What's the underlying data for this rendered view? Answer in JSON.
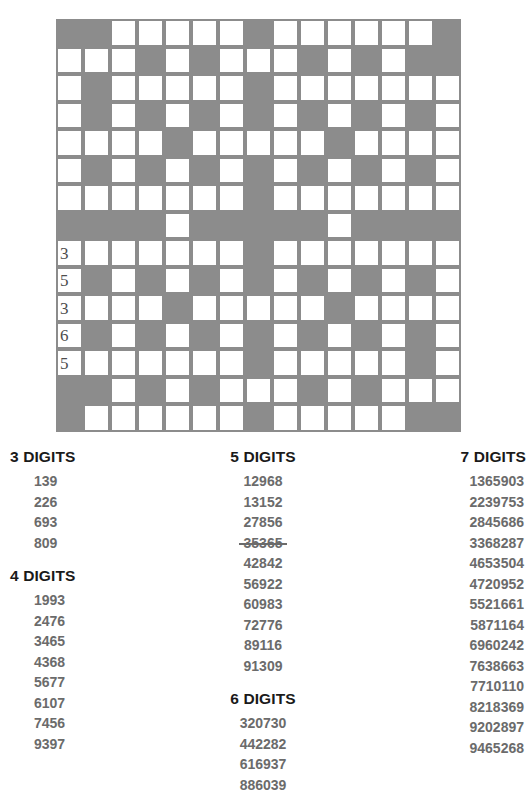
{
  "puzzle": {
    "title": "Number Fill-In",
    "grid": {
      "rows": 15,
      "cols": 15,
      "block_color": "#8c8c8c",
      "open_color": "#ffffff",
      "pattern": [
        "##.....#......#",
        "...#.#...#.#.##",
        ".#.....#.......",
        ".#.#.#.#.#.#.#.",
        "....#.....#....",
        ".#.#.#.#.#.#.#.",
        ".......#.......",
        "####.#####.####",
        ".......#.......",
        ".#.#.#.#.#.#.#.",
        "....#.....#....",
        ".#.#.#.#.#.#.#.",
        ".......#.....#.",
        "##.#.#...#.#...",
        "#......#.....##"
      ],
      "clues": [
        {
          "row": 8,
          "col": 0,
          "number": "3"
        },
        {
          "row": 9,
          "col": 0,
          "number": "5"
        },
        {
          "row": 10,
          "col": 0,
          "number": "3"
        },
        {
          "row": 11,
          "col": 0,
          "number": "6"
        },
        {
          "row": 12,
          "col": 0,
          "number": "5"
        }
      ]
    },
    "columns": [
      {
        "id": "left",
        "groups": [
          {
            "title": "3 DIGITS",
            "entries": [
              {
                "value": "139",
                "used": false
              },
              {
                "value": "226",
                "used": false
              },
              {
                "value": "693",
                "used": false
              },
              {
                "value": "809",
                "used": false
              }
            ]
          },
          {
            "title": "4 DIGITS",
            "entries": [
              {
                "value": "1993",
                "used": false
              },
              {
                "value": "2476",
                "used": false
              },
              {
                "value": "3465",
                "used": false
              },
              {
                "value": "4368",
                "used": false
              },
              {
                "value": "5677",
                "used": false
              },
              {
                "value": "6107",
                "used": false
              },
              {
                "value": "7456",
                "used": false
              },
              {
                "value": "9397",
                "used": false
              }
            ]
          }
        ]
      },
      {
        "id": "mid",
        "groups": [
          {
            "title": "5 DIGITS",
            "entries": [
              {
                "value": "12968",
                "used": false
              },
              {
                "value": "13152",
                "used": false
              },
              {
                "value": "27856",
                "used": false
              },
              {
                "value": "35365",
                "used": true
              },
              {
                "value": "42842",
                "used": false
              },
              {
                "value": "56922",
                "used": false
              },
              {
                "value": "60983",
                "used": false
              },
              {
                "value": "72776",
                "used": false
              },
              {
                "value": "89116",
                "used": false
              },
              {
                "value": "91309",
                "used": false
              }
            ]
          },
          {
            "title": "6 DIGITS",
            "entries": [
              {
                "value": "320730",
                "used": false
              },
              {
                "value": "442282",
                "used": false
              },
              {
                "value": "616937",
                "used": false
              },
              {
                "value": "886039",
                "used": false
              }
            ]
          }
        ]
      },
      {
        "id": "right",
        "groups": [
          {
            "title": "7 DIGITS",
            "entries": [
              {
                "value": "1365903",
                "used": false
              },
              {
                "value": "2239753",
                "used": false
              },
              {
                "value": "2845686",
                "used": false
              },
              {
                "value": "3368287",
                "used": false
              },
              {
                "value": "4653504",
                "used": false
              },
              {
                "value": "4720952",
                "used": false
              },
              {
                "value": "5521661",
                "used": false
              },
              {
                "value": "5871164",
                "used": false
              },
              {
                "value": "6960242",
                "used": false
              },
              {
                "value": "7638663",
                "used": false
              },
              {
                "value": "7710110",
                "used": false
              },
              {
                "value": "8218369",
                "used": false
              },
              {
                "value": "9202897",
                "used": false
              },
              {
                "value": "9465268",
                "used": false
              }
            ]
          }
        ]
      }
    ]
  }
}
